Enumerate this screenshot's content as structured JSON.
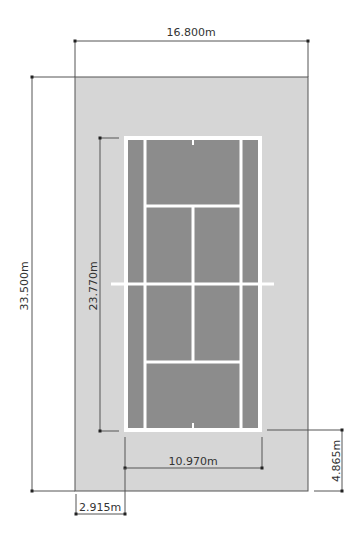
{
  "diagram": {
    "colors": {
      "background": "#ffffff",
      "surround": "#d6d6d6",
      "surround_border": "#555555",
      "court": "#8c8c8c",
      "lines": "#ffffff",
      "dimension": "#333333"
    },
    "dimensions": {
      "total_width": "16.800m",
      "total_length": "33.500m",
      "court_length": "23.770m",
      "singles_width": "10.970m",
      "end_clearance": "4.865m",
      "side_clearance": "2.915m"
    }
  }
}
